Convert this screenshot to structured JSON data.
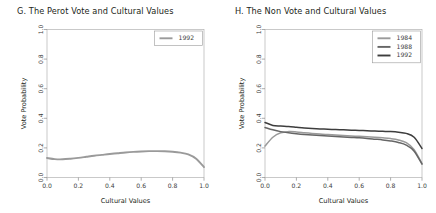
{
  "figure": {
    "width": 436,
    "height": 213,
    "background": "#ffffff"
  },
  "panels": [
    {
      "id": "panel-g",
      "title": "G. The Perot Vote and Cultural Values",
      "xlabel": "Cultural Values",
      "ylabel": "Vote Probability",
      "xticks": [
        "0.0",
        "0.2",
        "0.4",
        "0.6",
        "0.8",
        "1.0"
      ],
      "yticks": [
        "0.0",
        "0.2",
        "0.4",
        "0.6",
        "0.8",
        "1.0"
      ],
      "legend": [
        {
          "label": "1992",
          "color": "#9a9a9a"
        }
      ]
    },
    {
      "id": "panel-h",
      "title": "H. The Non Vote and Cultural Values",
      "xlabel": "Cultural Values",
      "ylabel": "Vote Probability",
      "xticks": [
        "0.0",
        "0.2",
        "0.4",
        "0.6",
        "0.8",
        "1.0"
      ],
      "yticks": [
        "0.0",
        "0.2",
        "0.4",
        "0.6",
        "0.8",
        "1.0"
      ],
      "legend": [
        {
          "label": "1984",
          "color": "#9a9a9a"
        },
        {
          "label": "1988",
          "color": "#666666"
        },
        {
          "label": "1992",
          "color": "#3d3d3d"
        }
      ]
    }
  ],
  "chart_data": [
    {
      "type": "line",
      "panel": "G",
      "title": "G. The Perot Vote and Cultural Values",
      "xlabel": "Cultural Values",
      "ylabel": "Vote Probability",
      "xlim": [
        0.0,
        1.0
      ],
      "ylim": [
        0.0,
        1.0
      ],
      "xticks": [
        0.0,
        0.2,
        0.4,
        0.6,
        0.8,
        1.0
      ],
      "yticks": [
        0.0,
        0.2,
        0.4,
        0.6,
        0.8,
        1.0
      ],
      "grid": false,
      "legend_position": "top-right",
      "x": [
        0.0,
        0.05,
        0.1,
        0.15,
        0.2,
        0.25,
        0.3,
        0.35,
        0.4,
        0.45,
        0.5,
        0.55,
        0.6,
        0.65,
        0.7,
        0.75,
        0.8,
        0.85,
        0.9,
        0.95,
        1.0
      ],
      "series": [
        {
          "name": "1992",
          "color": "#9a9a9a",
          "values": [
            0.132,
            0.124,
            0.123,
            0.127,
            0.133,
            0.14,
            0.147,
            0.153,
            0.159,
            0.164,
            0.169,
            0.173,
            0.176,
            0.178,
            0.178,
            0.177,
            0.174,
            0.168,
            0.156,
            0.127,
            0.07
          ]
        }
      ]
    },
    {
      "type": "line",
      "panel": "H",
      "title": "H. The Non Vote and Cultural Values",
      "xlabel": "Cultural Values",
      "ylabel": "Vote Probability",
      "xlim": [
        0.0,
        1.0
      ],
      "ylim": [
        0.0,
        1.0
      ],
      "xticks": [
        0.0,
        0.2,
        0.4,
        0.6,
        0.8,
        1.0
      ],
      "yticks": [
        0.0,
        0.2,
        0.4,
        0.6,
        0.8,
        1.0
      ],
      "grid": false,
      "legend_position": "top-right",
      "x": [
        0.0,
        0.05,
        0.1,
        0.15,
        0.2,
        0.25,
        0.3,
        0.35,
        0.4,
        0.45,
        0.5,
        0.55,
        0.6,
        0.65,
        0.7,
        0.75,
        0.8,
        0.85,
        0.9,
        0.95,
        1.0
      ],
      "series": [
        {
          "name": "1984",
          "color": "#9a9a9a",
          "values": [
            0.212,
            0.272,
            0.302,
            0.31,
            0.308,
            0.303,
            0.298,
            0.294,
            0.29,
            0.287,
            0.284,
            0.281,
            0.278,
            0.275,
            0.272,
            0.268,
            0.263,
            0.254,
            0.235,
            0.188,
            0.093
          ]
        },
        {
          "name": "1988",
          "color": "#666666",
          "values": [
            0.338,
            0.322,
            0.31,
            0.302,
            0.296,
            0.291,
            0.287,
            0.283,
            0.28,
            0.277,
            0.274,
            0.271,
            0.268,
            0.264,
            0.259,
            0.254,
            0.247,
            0.237,
            0.219,
            0.178,
            0.09
          ]
        },
        {
          "name": "1992",
          "color": "#3d3d3d",
          "values": [
            0.372,
            0.352,
            0.348,
            0.345,
            0.34,
            0.335,
            0.331,
            0.328,
            0.326,
            0.324,
            0.322,
            0.32,
            0.318,
            0.316,
            0.314,
            0.312,
            0.31,
            0.306,
            0.298,
            0.272,
            0.196
          ]
        }
      ]
    }
  ]
}
